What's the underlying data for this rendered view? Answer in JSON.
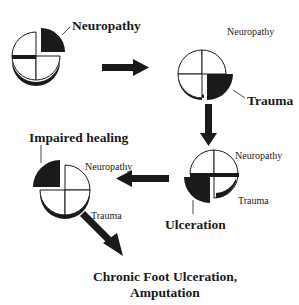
{
  "diagram": {
    "type": "flow-diagram",
    "colors": {
      "ink": "#1a1a1a",
      "fill": "#ffffff"
    },
    "stages": [
      {
        "id": "stage-1",
        "highlight": "Neuropathy",
        "labels": {
          "bold": "Neuropathy"
        }
      },
      {
        "id": "stage-2",
        "highlight": "Trauma",
        "labels": {
          "small": "Neuropathy",
          "bold": "Trauma"
        }
      },
      {
        "id": "stage-3",
        "highlight": "Ulceration",
        "labels": {
          "small_top": "Neuropathy",
          "small_bottom": "Trauma",
          "bold": "Ulceration"
        }
      },
      {
        "id": "stage-4",
        "highlight": "Impaired healing",
        "labels": {
          "bold": "Impaired healing",
          "small_top": "Neuropathy",
          "small_bottom": "Trauma"
        }
      }
    ],
    "outcome": {
      "line1": "Chronic Foot Ulceration,",
      "line2": "Amputation"
    },
    "arrows": [
      {
        "from": "stage-1",
        "to": "stage-2",
        "direction": "right"
      },
      {
        "from": "stage-2",
        "to": "stage-3",
        "direction": "down"
      },
      {
        "from": "stage-3",
        "to": "stage-4",
        "direction": "left"
      },
      {
        "from": "stage-4",
        "to": "outcome",
        "direction": "down-right"
      }
    ]
  }
}
